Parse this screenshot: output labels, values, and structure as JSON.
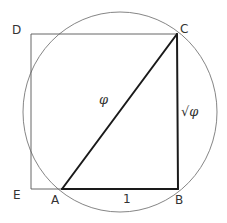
{
  "diagram": {
    "points": {
      "A": {
        "label": "A",
        "x": 62,
        "y": 189
      },
      "B": {
        "label": "B",
        "x": 178,
        "y": 189
      },
      "C": {
        "label": "C",
        "x": 177,
        "y": 34
      },
      "D": {
        "label": "D",
        "x": 31,
        "y": 34
      },
      "E": {
        "label": "E",
        "x": 31,
        "y": 189
      }
    },
    "edges": {
      "AC": {
        "label": "φ"
      },
      "BC": {
        "label": "√φ"
      },
      "AB": {
        "label": "1"
      }
    },
    "circle": {
      "cx": 120,
      "cy": 112,
      "rx": 97,
      "ry": 100
    },
    "colors": {
      "line": "#1a1a1a",
      "thin_line": "#555555",
      "circle": "#777777",
      "text": "#333333",
      "background": "#ffffff"
    }
  }
}
